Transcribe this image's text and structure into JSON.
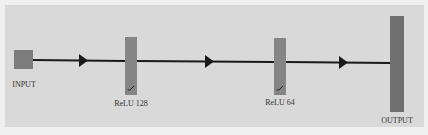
{
  "diagram": {
    "type": "neural-network-flow",
    "colors": {
      "panel_background": "#d9d9d9",
      "outer_background": "#f0f0f0",
      "node_fill": "#7c7c7c",
      "edge_color": "#1a1a1a",
      "label_color": "#333333"
    },
    "nodes": [
      {
        "id": "input",
        "label": "INPUT",
        "shape": "square"
      },
      {
        "id": "relu128",
        "label": "ReLU 128",
        "shape": "bar",
        "activation_glyph": "relu"
      },
      {
        "id": "relu64",
        "label": "ReLU 64",
        "shape": "bar",
        "activation_glyph": "relu"
      },
      {
        "id": "output",
        "label": "OUTPUT",
        "shape": "tall-bar"
      }
    ],
    "edges": [
      {
        "from": "input",
        "to": "relu128"
      },
      {
        "from": "relu128",
        "to": "relu64"
      },
      {
        "from": "relu64",
        "to": "output"
      }
    ]
  }
}
